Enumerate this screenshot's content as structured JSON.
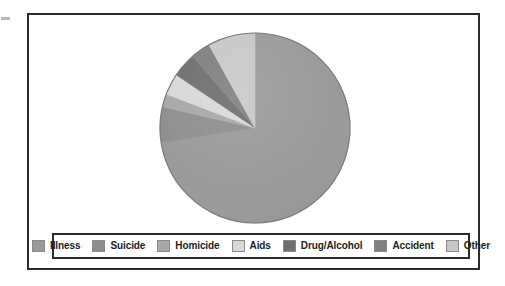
{
  "figure": {
    "background_color": "#ffffff",
    "frame_color": "#2b2b2b"
  },
  "legend": {
    "position": "bottom",
    "border_color": "#2b2b2b",
    "items": [
      {
        "label": "Illness",
        "color": "#9a9a9a"
      },
      {
        "label": "Suicide",
        "color": "#8e8e8e"
      },
      {
        "label": "Homicide",
        "color": "#a8a8a8"
      },
      {
        "label": "Aids",
        "color": "#d8d8d8"
      },
      {
        "label": "Drug/Alcohol",
        "color": "#6e6e6e"
      },
      {
        "label": "Accident",
        "color": "#808080"
      },
      {
        "label": "Other",
        "color": "#c8c8c8"
      }
    ]
  },
  "chart_data": {
    "type": "pie",
    "title": "",
    "subtitle": "",
    "xlabel": "",
    "ylabel": "",
    "legend_position": "bottom",
    "grid": false,
    "start_angle_deg": 0,
    "direction": "counterclockwise",
    "center": {
      "x": 226,
      "y": 113
    },
    "radius": 95,
    "categories": [
      "Illness",
      "Suicide",
      "Homicide",
      "Aids",
      "Drug/Alcohol",
      "Accident",
      "Other"
    ],
    "values": [
      72.5,
      6.1,
      2.2,
      3.6,
      4.2,
      3.3,
      8.1
    ],
    "percent_labels": [
      "72.5%",
      "6.1%",
      "2.2%",
      "3.6%",
      "4.2%",
      "3.3%",
      "8.1%"
    ],
    "slices": [
      {
        "name": "Illness",
        "value": 72.5,
        "color": "#9a9a9a",
        "start_deg": 0.0,
        "end_deg": 261.0
      },
      {
        "name": "Suicide",
        "value": 6.1,
        "color": "#8e8e8e",
        "start_deg": 261.0,
        "end_deg": 283.0
      },
      {
        "name": "Homicide",
        "value": 2.2,
        "color": "#a8a8a8",
        "start_deg": 283.0,
        "end_deg": 291.0
      },
      {
        "name": "Aids",
        "value": 3.6,
        "color": "#d8d8d8",
        "start_deg": 291.0,
        "end_deg": 304.0
      },
      {
        "name": "Drug/Alcohol",
        "value": 4.2,
        "color": "#6e6e6e",
        "start_deg": 304.0,
        "end_deg": 319.0
      },
      {
        "name": "Accident",
        "value": 3.3,
        "color": "#808080",
        "start_deg": 319.0,
        "end_deg": 331.0
      },
      {
        "name": "Other",
        "value": 8.1,
        "color": "#c8c8c8",
        "start_deg": 331.0,
        "end_deg": 360.0
      }
    ]
  }
}
